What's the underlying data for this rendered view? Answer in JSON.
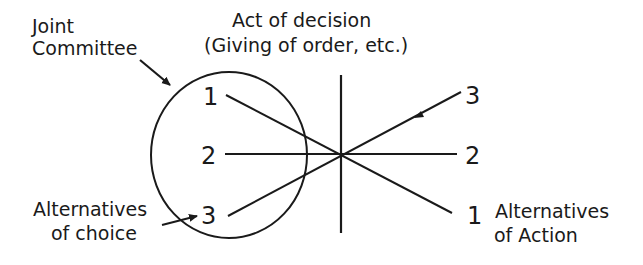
{
  "diagram": {
    "labels": {
      "joint_committee_line1": "Joint",
      "joint_committee_line2": "Committee",
      "act_of_decision_line1": "Act of decision",
      "act_of_decision_line2": "(Giving of order, etc.)",
      "alt_choice_line1": "Alternatives",
      "alt_choice_line2": "of choice",
      "alt_action_line1": "Alternatives",
      "alt_action_line2": "of Action"
    },
    "left_numbers": [
      "1",
      "2",
      "3"
    ],
    "right_numbers": [
      "3",
      "2",
      "1"
    ],
    "colors": {
      "ink": "#1a1a1a",
      "background": "#ffffff"
    }
  }
}
